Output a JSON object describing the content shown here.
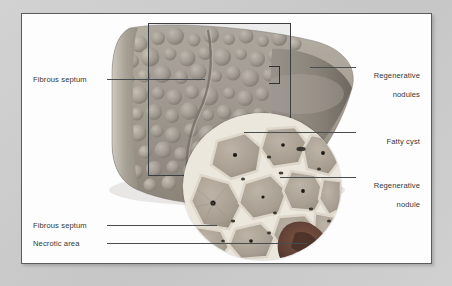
{
  "figure": {
    "kind": "medical-illustration",
    "background_color": "#c9c9c9",
    "plate_color": "#fdfdfd",
    "leader_color": "#4a4d4f"
  },
  "labels": {
    "left": [
      {
        "id": "fibrous-septum-top",
        "text": "Fibrous septum"
      },
      {
        "id": "fibrous-septum-bottom",
        "text": "Fibrous septum"
      },
      {
        "id": "necrotic-area",
        "text": "Necrotic area"
      }
    ],
    "right": [
      {
        "id": "regenerative-nodules",
        "line1": "Regenerative",
        "line2": "nodules"
      },
      {
        "id": "fatty-cyst",
        "line1": "Fatty cyst",
        "line2": ""
      },
      {
        "id": "regenerative-nodule",
        "line1": "Regenerative",
        "line2": "nodule"
      }
    ]
  },
  "specimen": {
    "name": "cirrhotic-liver",
    "surface": "nodular",
    "tone_light": "#b9b2a8",
    "tone_mid": "#9a9288",
    "tone_dark": "#6f6a63"
  },
  "inset": {
    "name": "histology-magnification",
    "shape": "circle",
    "nodule_fill": "#a39a8e",
    "septum_fill": "#ece7dd",
    "necrosis_fill": "#6b4a3c"
  },
  "overlay": {
    "roi_rect_name": "region-of-interest-rectangle",
    "bracket_name": "magnification-bracket"
  }
}
